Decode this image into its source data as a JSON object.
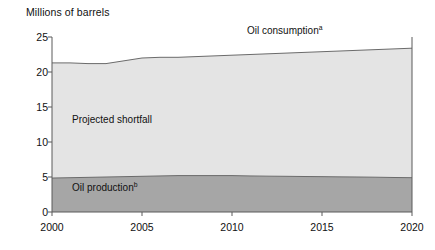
{
  "chart_data": {
    "type": "area",
    "title": "",
    "ylabel": "Millions of barrels",
    "xlabel": "",
    "xlim": [
      2000,
      2020
    ],
    "ylim": [
      0,
      25
    ],
    "grid": false,
    "legend_position": "inline-annotations",
    "x": [
      2000,
      2001,
      2002,
      2003,
      2004,
      2005,
      2006,
      2007,
      2008,
      2009,
      2010,
      2011,
      2012,
      2013,
      2014,
      2015,
      2016,
      2017,
      2018,
      2019,
      2020
    ],
    "series": [
      {
        "name": "Oil consumption",
        "footnote": "a",
        "stacking": "top-boundary",
        "color": "#e4e4e4",
        "values": [
          21.3,
          21.3,
          21.2,
          21.2,
          21.6,
          22.0,
          22.1,
          22.1,
          22.2,
          22.3,
          22.4,
          22.5,
          22.6,
          22.7,
          22.8,
          22.9,
          23.0,
          23.1,
          23.2,
          23.3,
          23.4
        ]
      },
      {
        "name": "Oil production",
        "footnote": "b",
        "stacking": "bottom-band",
        "color": "#a6a6a6",
        "values": [
          4.85,
          4.9,
          4.95,
          5.0,
          5.05,
          5.1,
          5.15,
          5.2,
          5.2,
          5.2,
          5.2,
          5.15,
          5.12,
          5.1,
          5.07,
          5.05,
          5.02,
          5.0,
          4.97,
          4.93,
          4.9
        ]
      }
    ],
    "regions": [
      {
        "name": "Projected shortfall",
        "color": "#e4e4e4",
        "description": "Area between oil consumption and oil production"
      }
    ],
    "ytick_labels": [
      "0",
      "5",
      "10",
      "15",
      "20",
      "25"
    ],
    "ytick_values": [
      0,
      5,
      10,
      15,
      20,
      25
    ],
    "xtick_labels": [
      "2000",
      "2005",
      "2010",
      "2015",
      "2020"
    ],
    "xtick_values": [
      2000,
      2005,
      2010,
      2015,
      2020
    ]
  },
  "annotations": {
    "oil_consumption": "Oil consumption",
    "oil_consumption_footnote": "a",
    "projected_shortfall": "Projected shortfall",
    "oil_production": "Oil production",
    "oil_production_footnote": "b"
  },
  "colors": {
    "shortfall_fill": "#e4e4e4",
    "production_fill": "#a6a6a6",
    "line": "#6b6b6b",
    "axis": "#5a5a5a",
    "text": "#111111"
  }
}
